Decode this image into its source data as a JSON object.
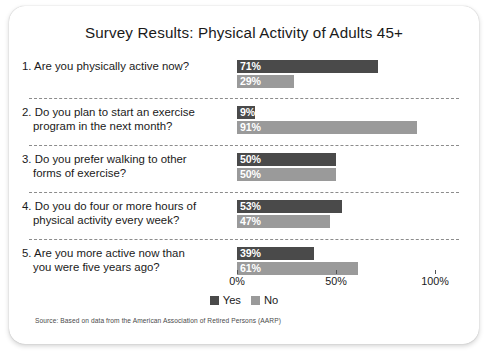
{
  "card": {
    "title": "Survey Results: Physical Activity of Adults 45+",
    "source": "Source: Based on data from the American Association of Retired Persons (AARP)"
  },
  "legend": {
    "yes_label": "Yes",
    "no_label": "No",
    "yes_color": "#4a4a4a",
    "no_color": "#9a9a9a"
  },
  "axis": {
    "ticks": [
      {
        "label": "0%",
        "value": 0
      },
      {
        "label": "50%",
        "value": 50
      },
      {
        "label": "100%",
        "value": 100
      }
    ]
  },
  "questions": [
    {
      "number": "1.",
      "lines": [
        "1. Are you physically active now?"
      ],
      "yes_label": "71%",
      "no_label": "29%",
      "yes": 71,
      "no": 29
    },
    {
      "number": "2.",
      "lines": [
        "2. Do you plan to start an exercise",
        "program in the next month?"
      ],
      "yes_label": "9%",
      "no_label": "91%",
      "yes": 9,
      "no": 91
    },
    {
      "number": "3.",
      "lines": [
        "3. Do you prefer walking to other",
        "forms of exercise?"
      ],
      "yes_label": "50%",
      "no_label": "50%",
      "yes": 50,
      "no": 50
    },
    {
      "number": "4.",
      "lines": [
        "4. Do you do four or more hours of",
        "physical activity every week?"
      ],
      "yes_label": "53%",
      "no_label": "47%",
      "yes": 53,
      "no": 47
    },
    {
      "number": "5.",
      "lines": [
        "5. Are you more active now than",
        "you were five years ago?"
      ],
      "yes_label": "39%",
      "no_label": "61%",
      "yes": 39,
      "no": 61
    }
  ],
  "chart_data": {
    "type": "bar",
    "title": "Survey Results: Physical Activity of Adults 45+",
    "orientation": "horizontal",
    "xlabel": "",
    "ylabel": "",
    "xlim": [
      0,
      100
    ],
    "xticks": [
      0,
      50,
      100
    ],
    "xticklabels": [
      "0%",
      "50%",
      "100%"
    ],
    "grid": false,
    "legend_position": "bottom-center",
    "categories": [
      "1. Are you physically active now?",
      "2. Do you plan to start an exercise program in the next month?",
      "3. Do you prefer walking to other forms of exercise?",
      "4. Do you do four or more hours of physical activity every week?",
      "5. Are you more active now than you were five years ago?"
    ],
    "series": [
      {
        "name": "Yes",
        "color": "#4a4a4a",
        "values": [
          71,
          9,
          50,
          53,
          39
        ]
      },
      {
        "name": "No",
        "color": "#9a9a9a",
        "values": [
          29,
          91,
          50,
          47,
          61
        ]
      }
    ],
    "data_labels": [
      {
        "Yes": "71%",
        "No": "29%"
      },
      {
        "Yes": "9%",
        "No": "91%"
      },
      {
        "Yes": "50%",
        "No": "50%"
      },
      {
        "Yes": "53%",
        "No": "47%"
      },
      {
        "Yes": "39%",
        "No": "61%"
      }
    ],
    "annotations": [
      "Source: Based on data from the American Association of Retired Persons (AARP)"
    ]
  }
}
